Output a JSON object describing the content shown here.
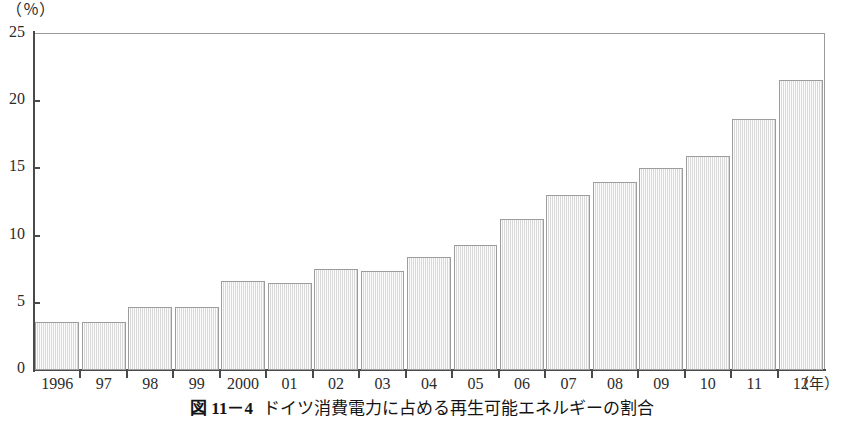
{
  "chart_data": {
    "type": "bar",
    "subtitle": "",
    "xlabel": "（年）",
    "ylabel": "（％）",
    "ylim": [
      0,
      25
    ],
    "yticks": [
      0,
      5,
      10,
      15,
      20,
      25
    ],
    "ytick_labels": [
      "0",
      "5",
      "10",
      "15",
      "20",
      "25"
    ],
    "grid": false,
    "legend": false,
    "categories": [
      "1996",
      "97",
      "98",
      "99",
      "2000",
      "01",
      "02",
      "03",
      "04",
      "05",
      "06",
      "07",
      "08",
      "09",
      "10",
      "11",
      "12"
    ],
    "values": [
      3.6,
      3.6,
      4.7,
      4.7,
      6.6,
      6.5,
      7.5,
      7.4,
      8.4,
      9.3,
      11.2,
      13.0,
      14.0,
      15.0,
      15.9,
      18.7,
      21.6
    ],
    "series": [
      {
        "name": "再生可能エネルギーの割合",
        "values": [
          3.6,
          3.6,
          4.7,
          4.7,
          6.6,
          6.5,
          7.5,
          7.4,
          8.4,
          9.3,
          11.2,
          13.0,
          14.0,
          15.0,
          15.9,
          18.7,
          21.6
        ]
      }
    ],
    "annotations": []
  },
  "axis": {
    "unit_label": "（％）",
    "x_unit_label": "（年）"
  },
  "caption": {
    "number": "図 11－4",
    "text": "ドイツ消費電力に占める再生可能エネルギーの割合"
  },
  "colors": {
    "bar_fill": "#ededed",
    "bar_border": "#9d9d9d",
    "axis": "#4a4a4a",
    "frame": "#8a8a8a",
    "text": "#2b2b2b"
  }
}
